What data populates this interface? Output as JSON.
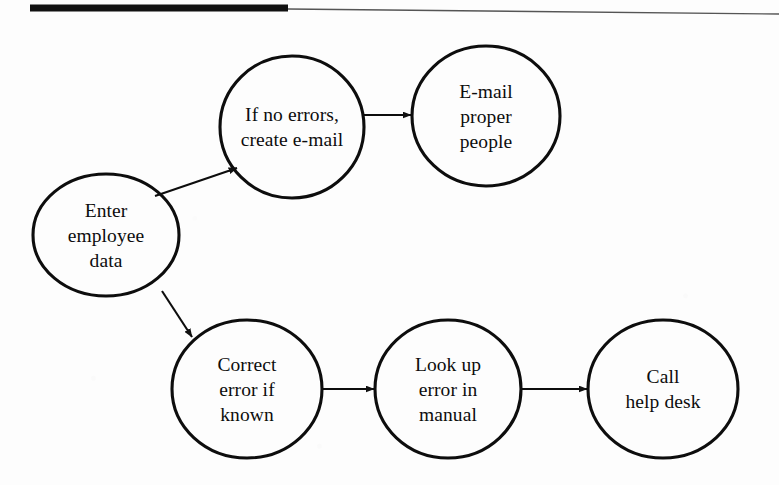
{
  "document": {
    "type": "flowchart-diagram",
    "background_color": "#fdfdfd",
    "ink_color": "#0d0d0d"
  },
  "header_rule": {
    "name": "horizontal-rule",
    "thick_segment": {
      "x1": 30,
      "x2": 288,
      "y": 8,
      "thickness": 7,
      "color": "#111111"
    },
    "thin_segment": {
      "x1": 288,
      "x2": 779,
      "y1": 9,
      "y2": 14,
      "thickness": 1.3,
      "color": "#555555"
    }
  },
  "nodes": [
    {
      "id": "enter-employee-data",
      "lines": [
        "Enter",
        "employee",
        "data"
      ],
      "cx": 106,
      "cy": 235,
      "rx": 73,
      "ry": 61
    },
    {
      "id": "if-no-errors-create-email",
      "lines": [
        "If no errors,",
        "create e-mail"
      ],
      "cx": 292,
      "cy": 127,
      "rx": 72,
      "ry": 71
    },
    {
      "id": "email-proper-people",
      "lines": [
        "E-mail",
        "proper",
        "people"
      ],
      "cx": 486,
      "cy": 116,
      "rx": 74,
      "ry": 70
    },
    {
      "id": "correct-error-if-known",
      "lines": [
        "Correct",
        "error if",
        "known"
      ],
      "cx": 247,
      "cy": 389,
      "rx": 75,
      "ry": 69
    },
    {
      "id": "look-up-error-in-manual",
      "lines": [
        "Look up",
        "error in",
        "manual"
      ],
      "cx": 448,
      "cy": 389,
      "rx": 73,
      "ry": 69
    },
    {
      "id": "call-help-desk",
      "lines": [
        "Call",
        "help desk"
      ],
      "cx": 663,
      "cy": 389,
      "rx": 75,
      "ry": 69
    }
  ],
  "edges": [
    {
      "id": "enter-to-if-no-errors",
      "from": "enter-employee-data",
      "to": "if-no-errors-create-email",
      "x1": 155,
      "y1": 196,
      "x2": 237,
      "y2": 168
    },
    {
      "id": "enter-to-correct-error",
      "from": "enter-employee-data",
      "to": "correct-error-if-known",
      "x1": 162,
      "y1": 291,
      "x2": 192,
      "y2": 337
    },
    {
      "id": "if-no-errors-to-email-people",
      "from": "if-no-errors-create-email",
      "to": "email-proper-people",
      "x1": 364,
      "y1": 115,
      "x2": 411,
      "y2": 115
    },
    {
      "id": "correct-error-to-look-up",
      "from": "correct-error-if-known",
      "to": "look-up-error-in-manual",
      "x1": 322,
      "y1": 389,
      "x2": 374,
      "y2": 389
    },
    {
      "id": "look-up-to-call-help-desk",
      "from": "look-up-error-in-manual",
      "to": "call-help-desk",
      "x1": 521,
      "y1": 389,
      "x2": 587,
      "y2": 389
    }
  ]
}
